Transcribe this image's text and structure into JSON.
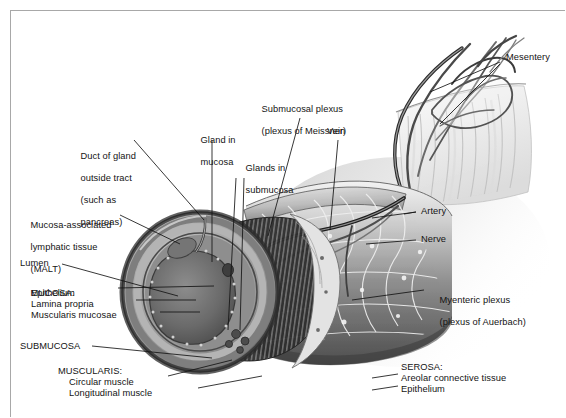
{
  "figure": {
    "type": "anatomical-illustration",
    "style": "grayscale medical drawing",
    "border_color": "#a8a8a8",
    "background_color": "#ffffff"
  },
  "labels": {
    "mesentery": "Mesentery",
    "submucosal_plexus_1": "Submucosal plexus",
    "submucosal_plexus_2": "(plexus of Meissner)",
    "vein": "Vein",
    "gland_in_mucosa_1": "Gland in",
    "gland_in_mucosa_2": "mucosa",
    "glands_in_submucosa_1": "Glands in",
    "glands_in_submucosa_2": "submucosa",
    "duct_1": "Duct of gland",
    "duct_2": "outside tract",
    "duct_3": "(such as",
    "duct_4": "pancreas)",
    "malt_1": "Mucosa-associated",
    "malt_2": "lymphatic tissue",
    "malt_3": "(MALT)",
    "lumen": "Lumen",
    "mucosa_heading": "MUCOSA:",
    "mucosa_epithelium": "Epithelium",
    "mucosa_lamina_propria": "Lamina propria",
    "mucosa_muscularis_mucosae": "Muscularis mucosae",
    "submucosa": "SUBMUCOSA",
    "muscularis_heading": "MUSCULARIS:",
    "muscularis_circular": "Circular muscle",
    "muscularis_longitudinal": "Longitudinal muscle",
    "artery": "Artery",
    "nerve": "Nerve",
    "myenteric_plexus_1": "Myenteric plexus",
    "myenteric_plexus_2": "(plexus of Auerbach)",
    "serosa_heading": "SEROSA:",
    "serosa_areolar": "Areolar connective tissue",
    "serosa_epithelium": "Epithelium"
  },
  "structures": [
    {
      "name": "mesentery",
      "description": "fan-shaped membrane upper right"
    },
    {
      "name": "blood-vessel-arcade",
      "description": "branching vessels top right"
    },
    {
      "name": "gut-tube",
      "description": "cylindrical tube running diagonally"
    },
    {
      "name": "cut-cross-section",
      "description": "circular cut face at left end"
    },
    {
      "name": "lumen",
      "description": "dark central cavity of cross-section"
    },
    {
      "name": "myenteric-plexus-network",
      "description": "mesh network over muscularis"
    },
    {
      "name": "circular-muscle-striations",
      "description": "vertical striations inside tube"
    }
  ]
}
